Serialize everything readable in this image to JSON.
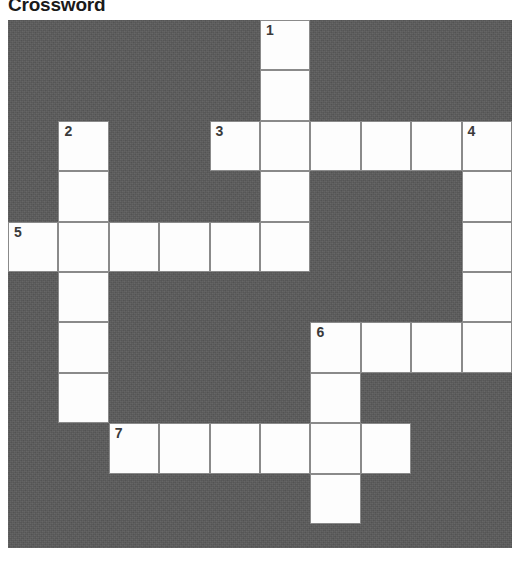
{
  "page": {
    "title": "Crossword"
  },
  "grid": {
    "columns": 10,
    "rows": 10,
    "cell_size": 50.4,
    "blocked_color": "#5a5a5a",
    "open_color": "#fdfdfd",
    "border_color": "#8a8a8a",
    "number_color": "#3a3a3a"
  },
  "cells": [
    {
      "row": 0,
      "col": 5,
      "number": "1"
    },
    {
      "row": 1,
      "col": 5,
      "number": ""
    },
    {
      "row": 2,
      "col": 1,
      "number": "2"
    },
    {
      "row": 2,
      "col": 4,
      "number": "3"
    },
    {
      "row": 2,
      "col": 5,
      "number": ""
    },
    {
      "row": 2,
      "col": 6,
      "number": ""
    },
    {
      "row": 2,
      "col": 7,
      "number": ""
    },
    {
      "row": 2,
      "col": 8,
      "number": ""
    },
    {
      "row": 2,
      "col": 9,
      "number": "4"
    },
    {
      "row": 3,
      "col": 1,
      "number": ""
    },
    {
      "row": 3,
      "col": 5,
      "number": ""
    },
    {
      "row": 3,
      "col": 9,
      "number": ""
    },
    {
      "row": 4,
      "col": 0,
      "number": "5"
    },
    {
      "row": 4,
      "col": 1,
      "number": ""
    },
    {
      "row": 4,
      "col": 2,
      "number": ""
    },
    {
      "row": 4,
      "col": 3,
      "number": ""
    },
    {
      "row": 4,
      "col": 4,
      "number": ""
    },
    {
      "row": 4,
      "col": 5,
      "number": ""
    },
    {
      "row": 4,
      "col": 9,
      "number": ""
    },
    {
      "row": 5,
      "col": 1,
      "number": ""
    },
    {
      "row": 5,
      "col": 9,
      "number": ""
    },
    {
      "row": 6,
      "col": 1,
      "number": ""
    },
    {
      "row": 6,
      "col": 6,
      "number": "6"
    },
    {
      "row": 6,
      "col": 7,
      "number": ""
    },
    {
      "row": 6,
      "col": 8,
      "number": ""
    },
    {
      "row": 6,
      "col": 9,
      "number": ""
    },
    {
      "row": 7,
      "col": 1,
      "number": ""
    },
    {
      "row": 7,
      "col": 6,
      "number": ""
    },
    {
      "row": 8,
      "col": 2,
      "number": "7"
    },
    {
      "row": 8,
      "col": 3,
      "number": ""
    },
    {
      "row": 8,
      "col": 4,
      "number": ""
    },
    {
      "row": 8,
      "col": 5,
      "number": ""
    },
    {
      "row": 8,
      "col": 6,
      "number": ""
    },
    {
      "row": 8,
      "col": 7,
      "number": ""
    },
    {
      "row": 9,
      "col": 6,
      "number": ""
    }
  ]
}
